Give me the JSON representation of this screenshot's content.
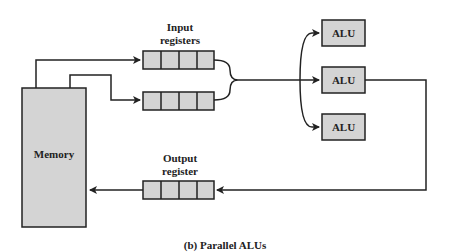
{
  "diagram": {
    "memory_label": "Memory",
    "input_label_line1": "Input",
    "input_label_line2": "registers",
    "output_label_line1": "Output",
    "output_label_line2": "register",
    "alus": [
      "ALU",
      "ALU",
      "ALU"
    ],
    "caption": "(b) Parallel ALUs",
    "register_cells": 4,
    "colors": {
      "box_fill": "#d4d4d4",
      "stroke": "#222222"
    }
  }
}
